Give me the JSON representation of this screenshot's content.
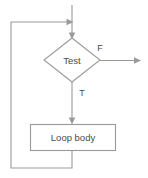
{
  "diagram": {
    "type": "flowchart",
    "canvas": {
      "width": 148,
      "height": 178,
      "background": "#ffffff"
    },
    "style": {
      "line_color": "#9a9a9a",
      "text_color": "#4a4a4a",
      "shape_fill": "#ffffff",
      "stroke_width": 1.1
    },
    "nodes": [
      {
        "id": "test",
        "shape": "diamond",
        "label": "Test",
        "cx": 72,
        "cy": 60,
        "half_width": 28,
        "half_height": 22
      },
      {
        "id": "loop-body",
        "shape": "rectangle",
        "label": "Loop body",
        "x": 30,
        "y": 124,
        "width": 86,
        "height": 27
      }
    ],
    "edges": [
      {
        "id": "entry",
        "label": "",
        "from": "start",
        "to": "test",
        "path": "M 72 5 L 72 36",
        "arrow_at": {
          "x": 72,
          "y": 38,
          "dir": "down"
        }
      },
      {
        "id": "false-branch",
        "label": "F",
        "label_x": 100,
        "label_y": 49,
        "from": "test",
        "to": "exit",
        "path": "M 100 60 L 138 60",
        "arrow_at": {
          "x": 141,
          "y": 60,
          "dir": "right"
        }
      },
      {
        "id": "true-branch",
        "label": "T",
        "label_x": 82,
        "label_y": 94,
        "from": "test",
        "to": "loop-body",
        "path": "M 72 82 L 72 122",
        "arrow_at": {
          "x": 72,
          "y": 124,
          "dir": "down"
        }
      },
      {
        "id": "feedback",
        "label": "",
        "from": "loop-body",
        "to": "test",
        "path": "M 72 151 L 72 168 L 11 168 L 11 22 L 70 22",
        "arrow_at": {
          "x": 73,
          "y": 22,
          "dir": "right"
        }
      }
    ]
  }
}
